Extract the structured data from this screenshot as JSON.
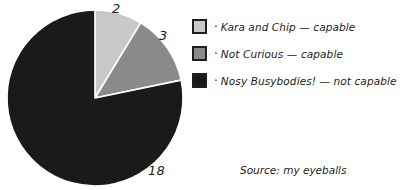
{
  "chart_data": {
    "type": "pie",
    "title": "",
    "categories": [
      "Kara and Chip — capable",
      "Not Curious — capable",
      "Nosy Busybodies! — not capable"
    ],
    "values": [
      2,
      3,
      18
    ],
    "total": 23,
    "value_labels": [
      "2",
      "3",
      "18"
    ],
    "colors": [
      "#c9c9c9",
      "#8a8a8a",
      "#1a1a1a"
    ],
    "slice_order": "clockwise from 12 o'clock",
    "legend_position": "right",
    "grid": false,
    "xlabel": "",
    "ylabel": "",
    "annotations": [
      "Source: my eyeballs"
    ]
  },
  "pie": {
    "center_x": 95,
    "center_y": 98,
    "radius": 88,
    "slices": [
      {
        "label": "Kara and Chip — capable",
        "value": 2,
        "color": "#c9c9c9",
        "value_label": "2"
      },
      {
        "label": "Not Curious — capable",
        "value": 3,
        "color": "#8a8a8a",
        "value_label": "3"
      },
      {
        "label": "Nosy Busybodies! — not capable",
        "value": 18,
        "color": "#1a1a1a",
        "value_label": "18"
      }
    ]
  },
  "legend": {
    "bullet": "·",
    "items": [
      {
        "label": "Kara and Chip — capable",
        "color": "#c9c9c9"
      },
      {
        "label": "Not Curious — capable",
        "color": "#8a8a8a"
      },
      {
        "label": "Nosy Busybodies! — not capable",
        "color": "#1a1a1a"
      }
    ]
  },
  "source": {
    "text": "Source: my eyeballs"
  },
  "title_remnant": {
    "text": "capable?"
  }
}
